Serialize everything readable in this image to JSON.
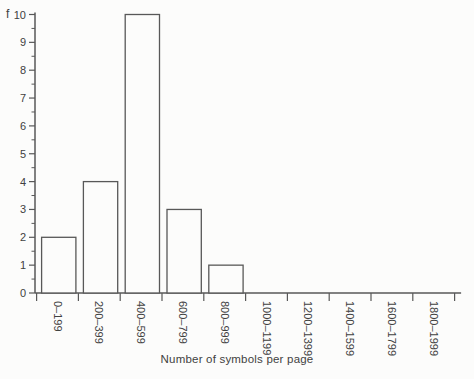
{
  "figure": {
    "background": "#fcfcfb",
    "line_color": "#585858",
    "text_color": "#414141",
    "bar_fill": "#fcfcfb"
  },
  "chart_data": {
    "type": "bar",
    "title": "",
    "xlabel": "Number of symbols per page",
    "ylabel": "f",
    "categories": [
      "0–199",
      "200–399",
      "400–599",
      "600–799",
      "800–999",
      "1000–1199",
      "1200–1399",
      "1400–1599",
      "1600–1799",
      "1800–1999"
    ],
    "values": [
      2,
      4,
      10,
      3,
      1,
      0,
      0,
      0,
      0,
      0
    ],
    "ylim": [
      0,
      10
    ],
    "yticks": [
      0,
      1,
      2,
      3,
      4,
      5,
      6,
      7,
      8,
      9,
      10
    ],
    "y_minor_tick_step": 0.5,
    "grid": false,
    "legend_position": "none"
  }
}
